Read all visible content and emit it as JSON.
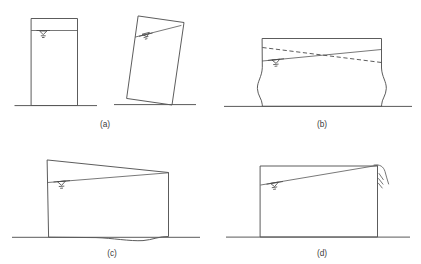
{
  "figure": {
    "stroke_color": "#4a4a4a",
    "ground_color": "#5a5a5a",
    "background_color": "#ffffff",
    "panel_count": 4
  },
  "panels": [
    {
      "id": "a",
      "caption": "(a)",
      "description": "Slender tank: undeformed upright tank at left and rigid-body rocking / overturning of the same tank at right",
      "elements": [
        "upright-tank-outline",
        "upright-tank-liquid-surface-line",
        "upright-tank-water-level-symbol",
        "upright-tank-ground-line",
        "tilted-tank-outline",
        "tilted-tank-liquid-surface-line",
        "tilted-tank-water-level-symbol",
        "tilted-tank-ground-line"
      ]
    },
    {
      "id": "b",
      "caption": "(b)",
      "description": "Broad tank: elephant-foot buckling of both side walls with sloshing liquid surface shown in two extreme positions (solid and dashed)",
      "elements": [
        "tank-outline-with-bulged-walls",
        "sloshing-surface-solid",
        "sloshing-surface-dashed",
        "water-level-symbol",
        "ground-line"
      ]
    },
    {
      "id": "c",
      "caption": "(c)",
      "description": "Broad tank uplift: base plate lifts at the left corner while the right corner stays down, liquid surface inclined",
      "elements": [
        "tank-outline-uplifted-base",
        "inclined-liquid-surface",
        "water-level-symbol",
        "ground-line"
      ]
    },
    {
      "id": "d",
      "caption": "(d)",
      "description": "Broad tank: liquid sloshes up and spills over the top of the right wall, splash indicated by short diagonal strokes",
      "elements": [
        "tank-outline",
        "inclined-liquid-surface-overtopping",
        "spill-curve-over-right-wall",
        "splash-strokes",
        "water-level-symbol",
        "ground-line"
      ]
    }
  ],
  "captions": {
    "a": "(a)",
    "b": "(b)",
    "c": "(c)",
    "d": "(d)"
  },
  "symbols": {
    "water_level": "inverted-triangle-with-tick-marks",
    "sloshing_alternate": "dashed-line",
    "splash": "three-short-diagonal-strokes"
  }
}
